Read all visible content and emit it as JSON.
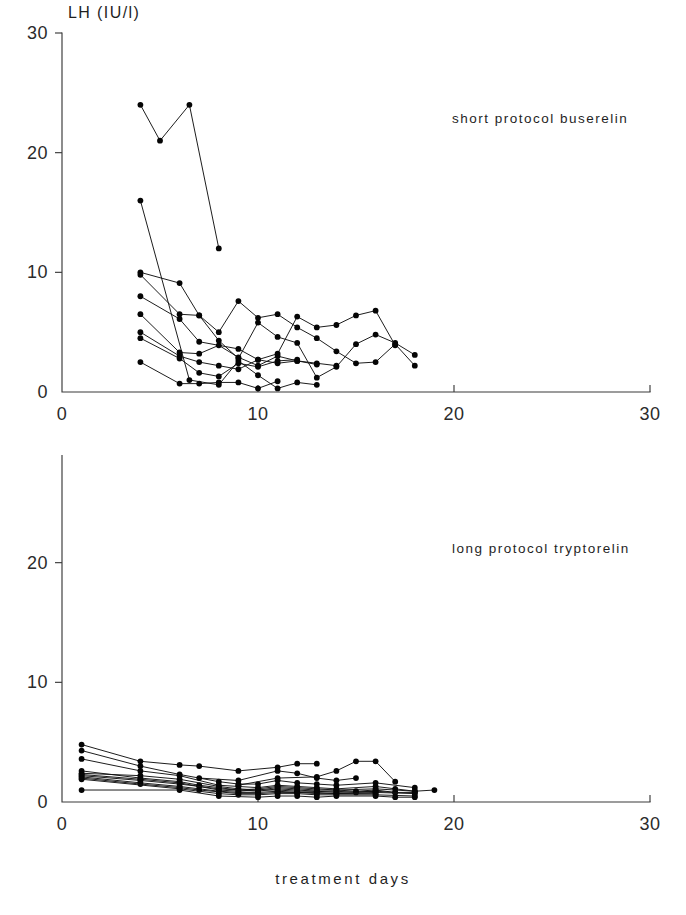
{
  "figure": {
    "y_axis_title": "LH (IU/l)",
    "x_axis_title": "treatment days"
  },
  "panels": {
    "top": {
      "annotation": "short protocol buserelin"
    },
    "bottom": {
      "annotation": "long protocol tryptorelin"
    }
  },
  "chart_data": [
    {
      "type": "line",
      "title": "short protocol buserelin",
      "xlabel": "treatment days",
      "ylabel": "LH (IU/l)",
      "xlim": [
        0,
        30
      ],
      "ylim": [
        0,
        30
      ],
      "xticks": [
        0,
        10,
        20,
        30
      ],
      "yticks": [
        0,
        10,
        20,
        30
      ],
      "grid": false,
      "legend": "none",
      "marker": "filled-circle",
      "series": [
        {
          "name": "patient-1",
          "x": [
            4,
            5,
            6.5,
            8
          ],
          "y": [
            24.0,
            21.0,
            24.0,
            12.0
          ]
        },
        {
          "name": "patient-2",
          "x": [
            4,
            6.5,
            8,
            9,
            10,
            11,
            12,
            13
          ],
          "y": [
            16.0,
            1.0,
            0.6,
            2.6,
            1.4,
            0.3,
            0.8,
            0.6
          ]
        },
        {
          "name": "patient-3",
          "x": [
            4,
            6,
            7,
            8,
            9,
            10,
            11,
            12,
            13,
            14,
            15,
            16,
            17,
            18
          ],
          "y": [
            10.0,
            9.1,
            6.4,
            4.3,
            2.8,
            5.8,
            4.6,
            4.1,
            1.2,
            2.1,
            4.0,
            4.8,
            4.1,
            3.1
          ]
        },
        {
          "name": "patient-4",
          "x": [
            4,
            6,
            7,
            8,
            9,
            10,
            11,
            12,
            13,
            14,
            15,
            16,
            17,
            18
          ],
          "y": [
            9.8,
            6.5,
            6.4,
            5.0,
            7.6,
            6.2,
            6.5,
            5.4,
            4.5,
            3.4,
            2.4,
            2.5,
            4.0,
            2.2
          ]
        },
        {
          "name": "patient-5",
          "x": [
            4,
            6,
            7,
            9,
            10,
            11,
            12,
            13,
            14,
            15,
            16,
            17
          ],
          "y": [
            8.0,
            6.1,
            4.2,
            3.6,
            2.7,
            3.2,
            6.3,
            5.4,
            5.6,
            6.4,
            6.8,
            3.9
          ]
        },
        {
          "name": "patient-6",
          "x": [
            4,
            6,
            7,
            8,
            9,
            10,
            11,
            12,
            13,
            14
          ],
          "y": [
            6.5,
            3.3,
            3.2,
            3.9,
            2.9,
            2.2,
            3.0,
            2.6,
            2.4,
            2.2
          ]
        },
        {
          "name": "patient-7",
          "x": [
            4,
            6,
            7,
            8,
            9,
            10,
            11,
            12,
            13
          ],
          "y": [
            5.0,
            3.0,
            2.5,
            2.2,
            1.9,
            2.7,
            2.4,
            2.6,
            2.3
          ]
        },
        {
          "name": "patient-8",
          "x": [
            4,
            6,
            7,
            8,
            9,
            10,
            11,
            12
          ],
          "y": [
            4.5,
            2.8,
            1.6,
            1.3,
            2.4,
            2.1,
            2.6,
            2.7
          ]
        },
        {
          "name": "patient-9",
          "x": [
            4,
            6,
            7,
            8,
            9,
            10,
            11
          ],
          "y": [
            2.5,
            0.7,
            0.7,
            0.8,
            0.8,
            0.3,
            0.9
          ]
        }
      ]
    },
    {
      "type": "line",
      "title": "long protocol tryptorelin",
      "xlabel": "treatment days",
      "ylabel": "LH (IU/l)",
      "xlim": [
        0,
        30
      ],
      "ylim": [
        0,
        30
      ],
      "xticks": [
        0,
        10,
        20,
        30
      ],
      "yticks": [
        0,
        10,
        20,
        30
      ],
      "grid": false,
      "legend": "none",
      "marker": "filled-circle",
      "series": [
        {
          "name": "patient-1",
          "x": [
            1,
            4,
            6,
            7,
            9,
            11,
            12,
            13
          ],
          "y": [
            4.8,
            3.4,
            3.1,
            3.0,
            2.6,
            2.9,
            3.2,
            3.2
          ]
        },
        {
          "name": "patient-2",
          "x": [
            1,
            4,
            6,
            8,
            9,
            10,
            11,
            12,
            13,
            14,
            16,
            18
          ],
          "y": [
            4.3,
            3.0,
            2.3,
            1.7,
            1.5,
            1.5,
            1.8,
            1.6,
            1.5,
            1.4,
            1.6,
            1.2
          ]
        },
        {
          "name": "patient-3",
          "x": [
            1,
            4,
            6,
            8,
            9,
            10,
            11,
            12,
            13,
            14,
            16,
            17,
            18,
            19
          ],
          "y": [
            3.6,
            2.6,
            2.2,
            1.4,
            1.3,
            1.2,
            1.4,
            1.3,
            1.2,
            1.1,
            1.3,
            1.1,
            0.9,
            1.0
          ]
        },
        {
          "name": "patient-4",
          "x": [
            1,
            4,
            6,
            7,
            8,
            9,
            10,
            11,
            12,
            13,
            14,
            16,
            18
          ],
          "y": [
            2.6,
            2.0,
            1.7,
            1.4,
            1.2,
            1.0,
            1.1,
            1.3,
            1.2,
            1.1,
            1.0,
            1.1,
            0.9
          ]
        },
        {
          "name": "patient-5",
          "x": [
            1,
            4,
            6,
            8,
            9,
            10,
            11,
            12,
            13,
            14,
            15,
            16,
            17,
            18
          ],
          "y": [
            2.4,
            2.2,
            1.9,
            1.3,
            1.1,
            1.0,
            1.2,
            1.1,
            1.0,
            1.0,
            0.9,
            1.0,
            0.8,
            0.8
          ]
        },
        {
          "name": "patient-6",
          "x": [
            1,
            4,
            6,
            7,
            8,
            9,
            10,
            11,
            12,
            13,
            14,
            16
          ],
          "y": [
            2.3,
            1.9,
            1.6,
            1.3,
            1.0,
            0.9,
            1.0,
            1.0,
            0.9,
            0.9,
            0.8,
            0.9
          ]
        },
        {
          "name": "patient-7",
          "x": [
            1,
            4,
            6,
            8,
            10,
            11,
            12,
            13,
            14,
            15,
            16,
            17
          ],
          "y": [
            2.2,
            1.8,
            1.5,
            1.1,
            0.9,
            1.1,
            1.0,
            0.9,
            0.9,
            0.8,
            0.9,
            0.8
          ]
        },
        {
          "name": "patient-8",
          "x": [
            1,
            4,
            6,
            8,
            9,
            10,
            11,
            12,
            13,
            14,
            16,
            18
          ],
          "y": [
            2.1,
            1.6,
            1.3,
            0.9,
            0.8,
            0.8,
            0.9,
            0.8,
            0.8,
            0.7,
            0.8,
            0.7
          ]
        },
        {
          "name": "patient-9",
          "x": [
            1,
            4,
            6,
            7,
            9,
            10,
            11,
            12,
            13,
            14,
            16
          ],
          "y": [
            2.0,
            1.5,
            1.2,
            1.0,
            0.7,
            0.7,
            0.8,
            0.8,
            0.7,
            0.7,
            0.7
          ]
        },
        {
          "name": "patient-10",
          "x": [
            1,
            6,
            8,
            9,
            10,
            11,
            12,
            13,
            14,
            16,
            18
          ],
          "y": [
            1.9,
            1.1,
            0.7,
            0.6,
            0.6,
            0.7,
            0.7,
            0.6,
            0.6,
            0.6,
            0.5
          ]
        },
        {
          "name": "patient-11",
          "x": [
            1,
            6,
            8,
            10,
            11,
            12,
            13,
            14,
            16,
            17,
            18
          ],
          "y": [
            1.0,
            1.0,
            0.5,
            0.4,
            0.5,
            0.5,
            0.4,
            0.5,
            0.5,
            0.4,
            0.4
          ]
        },
        {
          "name": "patient-12",
          "x": [
            7,
            9,
            11,
            12,
            13,
            14,
            15
          ],
          "y": [
            2.0,
            1.8,
            2.6,
            2.4,
            2.0,
            1.8,
            2.0
          ]
        },
        {
          "name": "patient-13",
          "x": [
            9,
            11,
            13,
            14,
            15,
            16,
            17
          ],
          "y": [
            1.4,
            2.0,
            2.1,
            2.6,
            3.4,
            3.4,
            1.7
          ]
        }
      ]
    }
  ]
}
